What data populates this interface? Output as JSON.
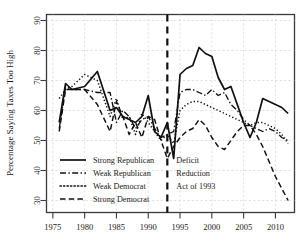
{
  "chart_data": {
    "type": "line",
    "title": "",
    "xlabel": "",
    "ylabel": "Percentage Saying Taxes Too High",
    "xlim": [
      1974,
      2013
    ],
    "ylim": [
      26,
      92
    ],
    "grid": true,
    "legend_position": "bottom-left",
    "xticks": [
      1975,
      1980,
      1985,
      1990,
      1995,
      2000,
      2005,
      2010
    ],
    "yticks": [
      30,
      40,
      50,
      60,
      70,
      80,
      90
    ],
    "annotations": [
      {
        "name": "deficit-reduction-act",
        "line1": "Deficit",
        "line2": "Reduction",
        "line3": "Act of 1993",
        "x": 1993,
        "type": "vertical-dashed-line-with-label"
      }
    ],
    "series": [
      {
        "name": "Strong Republican",
        "style": "solid",
        "x": [
          1976,
          1977,
          1978,
          1980,
          1982,
          1984,
          1985,
          1986,
          1987,
          1988,
          1989,
          1990,
          1991,
          1992,
          1993,
          1994,
          1995,
          1996,
          1997,
          1998,
          1999,
          2000,
          2001,
          2002,
          2003,
          2004,
          2005,
          2006,
          2007,
          2008,
          2009,
          2010,
          2011,
          2012
        ],
        "values": [
          56,
          69,
          67,
          68,
          73,
          60,
          61,
          58,
          57,
          56,
          58,
          65,
          53,
          51,
          56,
          44,
          72,
          74,
          75,
          81,
          79,
          78,
          71,
          67,
          68,
          62,
          56,
          51,
          56,
          64,
          63,
          62,
          61,
          59
        ]
      },
      {
        "name": "Weak Republican",
        "style": "dashdot",
        "x": [
          1976,
          1977,
          1978,
          1980,
          1982,
          1984,
          1985,
          1986,
          1987,
          1988,
          1989,
          1990,
          1991,
          1992,
          1993,
          1994,
          1995,
          1996,
          1997,
          1998,
          1999,
          2000,
          2001,
          2002,
          2003,
          2004,
          2005,
          2006,
          2007,
          2008,
          2009,
          2010,
          2011,
          2012
        ],
        "values": [
          54,
          68,
          67,
          67,
          66,
          66,
          56,
          60,
          58,
          54,
          57,
          58,
          54,
          51,
          52,
          53,
          66,
          67,
          67,
          66,
          65,
          67,
          65,
          66,
          62,
          60,
          57,
          55,
          54,
          53,
          54,
          53,
          51,
          50
        ]
      },
      {
        "name": "Weak Democrat",
        "style": "dotted",
        "x": [
          1976,
          1977,
          1978,
          1980,
          1982,
          1984,
          1985,
          1986,
          1987,
          1988,
          1989,
          1990,
          1991,
          1992,
          1993,
          1994,
          1995,
          1996,
          1997,
          1998,
          1999,
          2000,
          2001,
          2002,
          2003,
          2004,
          2005,
          2006,
          2007,
          2008,
          2009,
          2010,
          2011,
          2012
        ],
        "values": [
          64,
          67,
          68,
          72,
          70,
          58,
          64,
          57,
          58,
          52,
          59,
          56,
          53,
          50,
          52,
          49,
          60,
          62,
          63,
          63,
          62,
          61,
          60,
          59,
          58,
          57,
          56,
          55,
          56,
          56,
          55,
          54,
          52,
          49
        ]
      },
      {
        "name": "Strong Democrat",
        "style": "dashed",
        "x": [
          1976,
          1977,
          1978,
          1980,
          1982,
          1984,
          1985,
          1986,
          1987,
          1988,
          1989,
          1990,
          1991,
          1992,
          1993,
          1994,
          1995,
          1996,
          1997,
          1998,
          1999,
          2000,
          2001,
          2002,
          2003,
          2004,
          2005,
          2006,
          2007,
          2008,
          2009,
          2010,
          2011,
          2012
        ],
        "values": [
          53,
          67,
          67,
          67,
          62,
          53,
          63,
          58,
          52,
          56,
          51,
          58,
          57,
          50,
          44,
          48,
          51,
          53,
          54,
          57,
          55,
          51,
          48,
          47,
          50,
          53,
          55,
          55,
          52,
          48,
          43,
          38,
          34,
          30
        ]
      }
    ]
  },
  "legend": {
    "items": [
      {
        "label": "Strong Republican",
        "style": "solid"
      },
      {
        "label": "Weak Republican",
        "style": "dashdot"
      },
      {
        "label": "Weak Democrat",
        "style": "dotted"
      },
      {
        "label": "Strong Democrat",
        "style": "dashed"
      }
    ]
  },
  "axes": {
    "y_title": "Percentage Saying Taxes Too High",
    "y_tick_labels": [
      "90",
      "80",
      "70",
      "60",
      "50",
      "40",
      "30"
    ],
    "x_tick_labels": [
      "1975",
      "1980",
      "1985",
      "1990",
      "1995",
      "2000",
      "2005",
      "2010"
    ]
  }
}
